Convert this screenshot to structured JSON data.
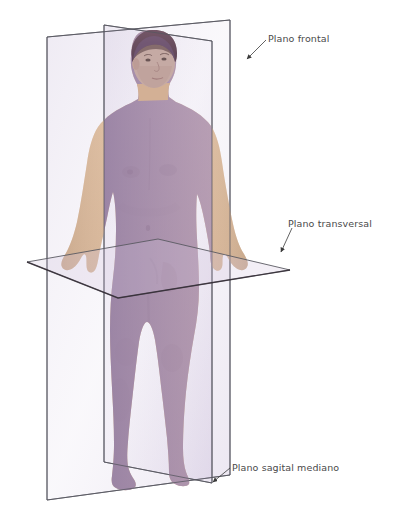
{
  "figure": {
    "background_color": "#ffffff",
    "line_color": "#4a4a50",
    "label_color": "#4a4a4a",
    "body_skin_color": "#d8b79c",
    "body_tint_color": "#9b86b4",
    "plane_fill_color": "#b9a8cd"
  },
  "labels": [
    {
      "id": "frontal",
      "text": "Plano frontal",
      "x": 268,
      "y": 33,
      "leader": {
        "x1": 266,
        "y1": 40,
        "x2": 247,
        "y2": 59
      },
      "arrow": {
        "x": 245,
        "y": 61
      }
    },
    {
      "id": "transversal",
      "text": "Plano transversal",
      "x": 288,
      "y": 218,
      "leader": {
        "x1": 292,
        "y1": 228,
        "x2": 281,
        "y2": 252
      },
      "arrow": {
        "x": 280,
        "y": 255
      }
    },
    {
      "id": "sagital",
      "text": "Plano sagital mediano",
      "x": 232,
      "y": 462,
      "leader": {
        "x1": 230,
        "y1": 468,
        "x2": 213,
        "y2": 482
      },
      "arrow": {
        "x": 211,
        "y": 484
      }
    }
  ],
  "planes": {
    "frontal": {
      "name": "Plano frontal",
      "orientation": "vertical-coronal",
      "corners": [
        {
          "x": 47,
          "y": 37
        },
        {
          "x": 230,
          "y": 20
        },
        {
          "x": 230,
          "y": 475
        },
        {
          "x": 47,
          "y": 500
        }
      ]
    },
    "sagital": {
      "name": "Plano sagital mediano",
      "orientation": "vertical-median",
      "corners": [
        {
          "x": 104,
          "y": 25
        },
        {
          "x": 212,
          "y": 41
        },
        {
          "x": 212,
          "y": 483
        },
        {
          "x": 104,
          "y": 462
        }
      ]
    },
    "transversal": {
      "name": "Plano transversal",
      "orientation": "horizontal",
      "corners": [
        {
          "x": 27,
          "y": 262
        },
        {
          "x": 158,
          "y": 239
        },
        {
          "x": 290,
          "y": 270
        },
        {
          "x": 118,
          "y": 298
        }
      ]
    }
  },
  "body": {
    "pose": "posición anatómica de pie",
    "view": "tres cuartos frontal",
    "tinted_half": "lado izquierdo de la imagen / lado derecho anatómico"
  }
}
